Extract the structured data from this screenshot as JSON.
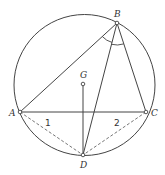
{
  "diagram": {
    "type": "inscribed-circle-geometry",
    "stroke_color": "#444444",
    "points": {
      "A": {
        "label": "A"
      },
      "B": {
        "label": "B"
      },
      "C": {
        "label": "C"
      },
      "D": {
        "label": "D"
      },
      "G": {
        "label": "G"
      }
    },
    "segments": [
      {
        "from": "A",
        "to": "B",
        "style": "solid"
      },
      {
        "from": "B",
        "to": "C",
        "style": "solid"
      },
      {
        "from": "A",
        "to": "C",
        "style": "solid"
      },
      {
        "from": "B",
        "to": "D",
        "style": "solid"
      },
      {
        "from": "G",
        "to": "D",
        "style": "solid"
      },
      {
        "from": "A",
        "to": "D",
        "style": "dashed"
      },
      {
        "from": "C",
        "to": "D",
        "style": "dashed"
      }
    ],
    "angle_marks": [
      {
        "vertex": "B",
        "between": [
          "A",
          "D"
        ]
      },
      {
        "vertex": "B",
        "between": [
          "D",
          "C"
        ]
      }
    ],
    "region_labels": [
      {
        "text": "1",
        "region": "left-of-D-below-AC"
      },
      {
        "text": "2",
        "region": "right-of-D-below-AC"
      }
    ]
  }
}
